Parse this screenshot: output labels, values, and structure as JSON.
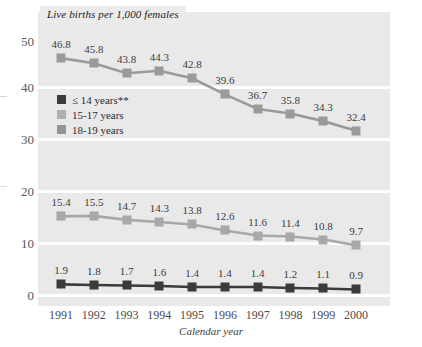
{
  "chart_data": {
    "type": "line",
    "title": "Live births per 1,000 females",
    "xlabel": "Calendar year",
    "ylabel": "",
    "categories": [
      "1991",
      "1992",
      "1993",
      "1994",
      "1995",
      "1996",
      "1997",
      "1998",
      "1999",
      "2000"
    ],
    "ylim": [
      0,
      50
    ],
    "yticks": [
      "0",
      "10",
      "20",
      "30",
      "40",
      "50"
    ],
    "grid": true,
    "legend_position": "inside-upper-left",
    "series": [
      {
        "name": "18-19 years",
        "color": "#9a9a9a",
        "values": [
          46.8,
          45.8,
          43.8,
          44.3,
          42.8,
          39.6,
          36.7,
          35.8,
          34.3,
          32.4
        ],
        "labels": [
          "46.8",
          "45.8",
          "43.8",
          "44.3",
          "42.8",
          "39.6",
          "36.7",
          "35.8",
          "34.3",
          "32.4"
        ]
      },
      {
        "name": "15-17 years",
        "color": "#a8a8a8",
        "values": [
          15.4,
          15.5,
          14.7,
          14.3,
          13.8,
          12.6,
          11.6,
          11.4,
          10.8,
          9.7
        ],
        "labels": [
          "15.4",
          "15.5",
          "14.7",
          "14.3",
          "13.8",
          "12.6",
          "11.6",
          "11.4",
          "10.8",
          "9.7"
        ]
      },
      {
        "name": "≤ 14 years**",
        "color": "#3b3b3b",
        "values": [
          1.9,
          1.8,
          1.7,
          1.6,
          1.4,
          1.4,
          1.4,
          1.2,
          1.1,
          0.9
        ],
        "labels": [
          "1.9",
          "1.8",
          "1.7",
          "1.6",
          "1.4",
          "1.4",
          "1.4",
          "1.2",
          "1.1",
          "0.9"
        ]
      }
    ]
  },
  "legend": {
    "items": [
      {
        "label": "≤ 14 years**",
        "color": "#3b3b3b"
      },
      {
        "label": "15-17 years",
        "color": "#b0b0b0"
      },
      {
        "label": "18-19 years",
        "color": "#949494"
      }
    ]
  },
  "colors": {
    "panel_background": "#e9e9e9",
    "gridline": "#ffffff",
    "title_background": "#ebebeb",
    "page_background": "#ffffff"
  }
}
